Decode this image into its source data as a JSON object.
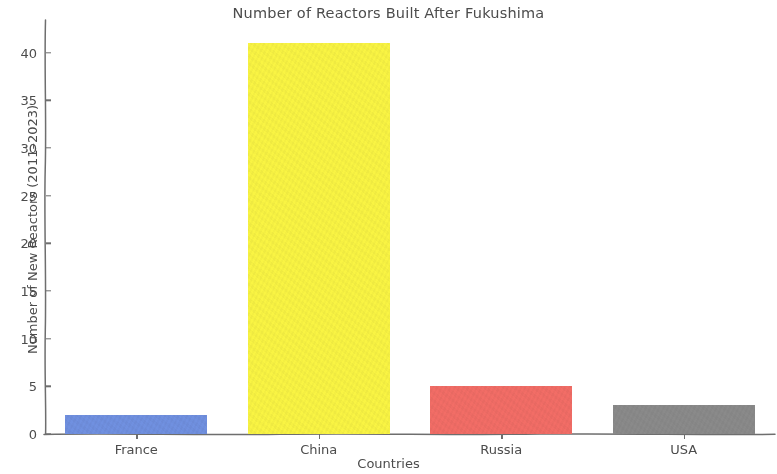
{
  "chart_data": {
    "type": "bar",
    "title": "Number of Reactors Built After Fukushima",
    "xlabel": "Countries",
    "ylabel": "Number of New Reactors (2011–2023)",
    "categories": [
      "France",
      "China",
      "Russia",
      "USA"
    ],
    "values": [
      2,
      41,
      5,
      3
    ],
    "bar_colors": [
      "#7090e0",
      "#f9f443",
      "#f26d66",
      "#8a8a8a"
    ],
    "ylim": [
      0,
      43
    ],
    "xlim": [
      0,
      4
    ],
    "yticks": [
      0,
      5,
      10,
      15,
      20,
      25,
      30,
      35,
      40
    ],
    "ytick_labels": [
      "0",
      "5",
      "10",
      "15",
      "20",
      "25",
      "30",
      "35",
      "40"
    ],
    "grid": false,
    "legend": null,
    "style": "xkcd-sketch",
    "spines": [
      "left",
      "bottom"
    ],
    "series": [
      {
        "name": "New Reactors",
        "points": [
          {
            "category": "France",
            "value": 2,
            "color": "#7090e0"
          },
          {
            "category": "China",
            "value": 41,
            "color": "#f9f443"
          },
          {
            "category": "Russia",
            "value": 5,
            "color": "#f26d66"
          },
          {
            "category": "USA",
            "value": 3,
            "color": "#8a8a8a"
          }
        ]
      }
    ]
  },
  "colors": {
    "text": "#4c4c4c",
    "axis": "#6e6e6e",
    "background": "#ffffff"
  }
}
